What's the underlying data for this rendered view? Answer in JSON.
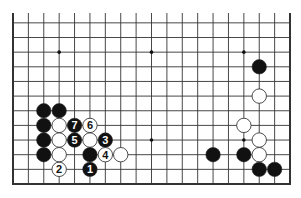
{
  "board": {
    "columns": 19,
    "rows_shown": 12,
    "edges": {
      "left": true,
      "right": true,
      "bottom": true,
      "top": false
    },
    "origin_x": 13,
    "origin_y_bottom": 184,
    "spacing_x": 15.39,
    "spacing_y": 14.65,
    "top_extent": 13,
    "line_color": "#333333",
    "star_points": [
      {
        "col": 3,
        "row": 10
      },
      {
        "col": 9,
        "row": 10
      },
      {
        "col": 15,
        "row": 10
      },
      {
        "col": 9,
        "row": 4
      },
      {
        "col": 15,
        "row": 4
      }
    ]
  },
  "stones": [
    {
      "color": "black",
      "col": 2,
      "row": 6,
      "label": ""
    },
    {
      "color": "black",
      "col": 3,
      "row": 6,
      "label": ""
    },
    {
      "color": "black",
      "col": 2,
      "row": 5,
      "label": ""
    },
    {
      "color": "black",
      "col": 2,
      "row": 4,
      "label": ""
    },
    {
      "color": "black",
      "col": 2,
      "row": 3,
      "label": ""
    },
    {
      "color": "white",
      "col": 3,
      "row": 5,
      "label": ""
    },
    {
      "color": "white",
      "col": 3,
      "row": 4,
      "label": ""
    },
    {
      "color": "white",
      "col": 3,
      "row": 3,
      "label": ""
    },
    {
      "color": "white",
      "col": 5,
      "row": 4,
      "label": ""
    },
    {
      "color": "black",
      "col": 5,
      "row": 3,
      "label": ""
    },
    {
      "color": "white",
      "col": 7,
      "row": 3,
      "label": ""
    },
    {
      "color": "black",
      "col": 5,
      "row": 2,
      "label": "1"
    },
    {
      "color": "white",
      "col": 3,
      "row": 2,
      "label": "2"
    },
    {
      "color": "black",
      "col": 6,
      "row": 4,
      "label": "3"
    },
    {
      "color": "white",
      "col": 6,
      "row": 3,
      "label": "4"
    },
    {
      "color": "black",
      "col": 4,
      "row": 4,
      "label": "5"
    },
    {
      "color": "white",
      "col": 5,
      "row": 5,
      "label": "6"
    },
    {
      "color": "black",
      "col": 4,
      "row": 5,
      "label": "7"
    },
    {
      "color": "black",
      "col": 16,
      "row": 9,
      "label": ""
    },
    {
      "color": "white",
      "col": 16,
      "row": 7,
      "label": ""
    },
    {
      "color": "white",
      "col": 15,
      "row": 5,
      "label": ""
    },
    {
      "color": "white",
      "col": 16,
      "row": 4,
      "label": ""
    },
    {
      "color": "white",
      "col": 16,
      "row": 3,
      "label": ""
    },
    {
      "color": "black",
      "col": 13,
      "row": 3,
      "label": ""
    },
    {
      "color": "black",
      "col": 15,
      "row": 3,
      "label": ""
    },
    {
      "color": "black",
      "col": 16,
      "row": 2,
      "label": ""
    },
    {
      "color": "black",
      "col": 17,
      "row": 2,
      "label": ""
    }
  ]
}
